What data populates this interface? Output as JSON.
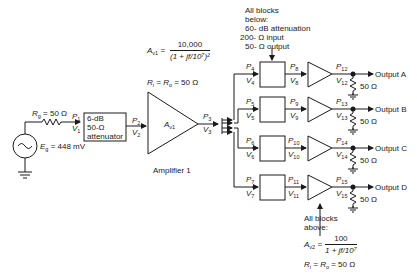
{
  "source": {
    "rg_label": "R",
    "rg_sub": "g",
    "rg_value": " = 50 Ω",
    "eg_label": "E",
    "eg_sub": "g",
    "eg_value": " = 448 mV"
  },
  "attenuator": {
    "line1": "6-dB",
    "line2": "50-Ω",
    "line3": "attenuator"
  },
  "amplifier1": {
    "label": "Amplifier 1",
    "gain_symbol": "A",
    "gain_sub": "v1",
    "formula_lhs": "A",
    "formula_lhs_sub": "v1",
    "formula_eq": " = ",
    "formula_num": "10,000",
    "formula_den": "(1 + jf/10⁷)²",
    "resistance": "R",
    "resistance_i": "i",
    "resistance_mid": " = R",
    "resistance_o": "o",
    "resistance_val": " = 50 Ω"
  },
  "nodes": {
    "p1": "P",
    "p1s": "1",
    "v1": "V",
    "v1s": "1",
    "p2": "P",
    "p2s": "2",
    "v2": "V",
    "v2s": "2",
    "p3": "P",
    "p3s": "3",
    "v3": "V",
    "v3s": "3"
  },
  "branches": [
    {
      "pin": "4",
      "vin": "4",
      "pmid": "8",
      "vmid": "8",
      "pout": "12",
      "vout": "12",
      "output": "Output A",
      "load": "50 Ω"
    },
    {
      "pin": "5",
      "vin": "5",
      "pmid": "9",
      "vmid": "9",
      "pout": "13",
      "vout": "13",
      "output": "Output B",
      "load": "50 Ω"
    },
    {
      "pin": "6",
      "vin": "6",
      "pmid": "10",
      "vmid": "10",
      "pout": "14",
      "vout": "14",
      "output": "Output C",
      "load": "50 Ω"
    },
    {
      "pin": "7",
      "vin": "7",
      "pmid": "11",
      "vmid": "11",
      "pout": "15",
      "vout": "15",
      "output": "Output D",
      "load": "50 Ω"
    }
  ],
  "attenuator_note": {
    "line1": "All blocks",
    "line2": "below:",
    "line3": "60- dB attenuation",
    "line4": "200- Ω input",
    "line5": "50- Ω output"
  },
  "amp2_note": {
    "line1": "All blocks",
    "line2": "above:",
    "gain": "A",
    "gain_sub": "v2",
    "eq": " = ",
    "num": "100",
    "den": "1 + jf/10⁷",
    "resistance": "R",
    "resistance_i": "i",
    "resistance_mid": " = R",
    "resistance_o": "o",
    "resistance_val": " = 50 Ω"
  },
  "colors": {
    "line": "#1a1a1a",
    "background": "#ffffff"
  }
}
